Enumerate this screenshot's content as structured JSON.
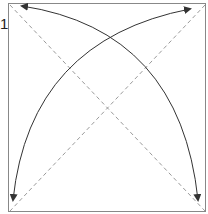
{
  "diagram": {
    "type": "origami-fold-step",
    "step_number": "1",
    "square": {
      "x": 8,
      "y": 3,
      "width": 198,
      "height": 209,
      "stroke": "#888888"
    },
    "crease_lines": [
      {
        "name": "diagonal-tl-br",
        "from": [
          10,
          5
        ],
        "to": [
          205,
          211
        ],
        "style": "dashed",
        "color": "#9a9a9a"
      },
      {
        "name": "diagonal-tr-bl",
        "from": [
          205,
          5
        ],
        "to": [
          10,
          211
        ],
        "style": "dashed",
        "color": "#9a9a9a"
      }
    ],
    "arrows": [
      {
        "name": "fold-arrow-tl-to-br",
        "description": "curved two-headed arrow from top-left corner to bottom-right corner",
        "color": "#333333"
      },
      {
        "name": "fold-arrow-tr-to-bl",
        "description": "curved two-headed arrow from top-right corner to bottom-left corner",
        "color": "#333333"
      }
    ]
  }
}
